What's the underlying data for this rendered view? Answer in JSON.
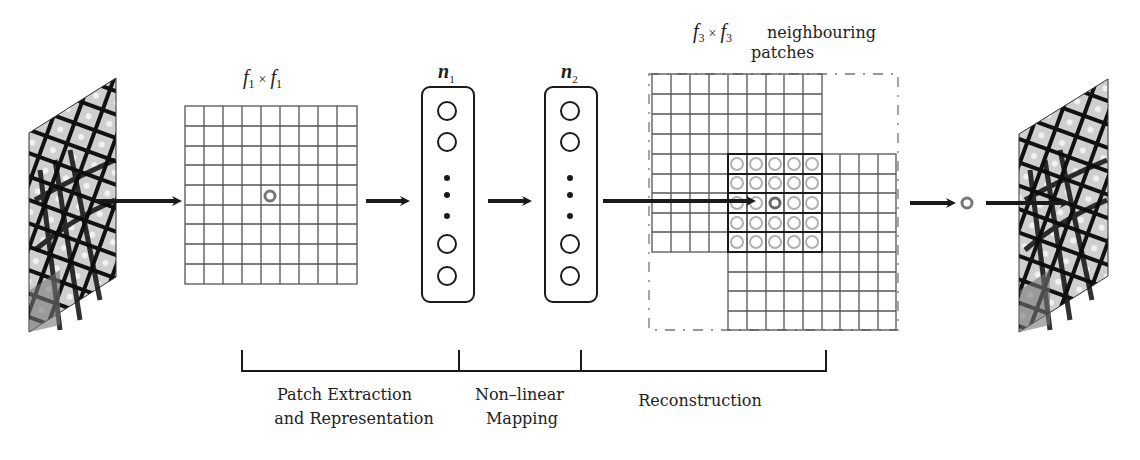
{
  "diagram": {
    "input_image": {
      "label": "low-resolution butterfly image"
    },
    "output_image": {
      "label": "high-resolution butterfly image"
    },
    "filter1": {
      "symbol": "f",
      "subscript": "1",
      "times": "×",
      "grid_cols": 9,
      "grid_rows": 9
    },
    "layer1": {
      "symbol": "n",
      "subscript": "1"
    },
    "layer2": {
      "symbol": "n",
      "subscript": "2"
    },
    "filter3": {
      "symbol": "f",
      "subscript": "3",
      "times": "×",
      "caption_line1": "neighbouring",
      "caption_line2": "patches",
      "grid_cols": 9,
      "grid_rows": 9,
      "overlap_cols": 5,
      "overlap_rows": 5
    },
    "stages": [
      {
        "line1": "Patch Extraction",
        "line2": "and Representation"
      },
      {
        "line1": "Non–linear",
        "line2": "Mapping"
      },
      {
        "line1": "Reconstruction",
        "line2": ""
      }
    ],
    "colors": {
      "line": "#1a1a1a",
      "grid": "#555555",
      "ghost_circle": "#b0b0b0",
      "pixel": "#777777"
    }
  }
}
